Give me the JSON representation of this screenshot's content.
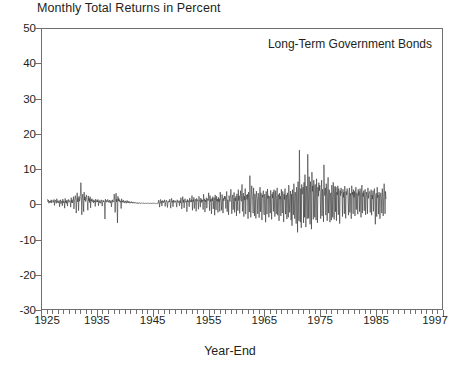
{
  "chart_data": {
    "type": "line",
    "title": "Monthly Total Returns in Percent",
    "annotation": "Long-Term Government Bonds",
    "xlabel": "Year-End",
    "ylabel": "",
    "xlim": [
      1925,
      1997
    ],
    "ylim": [
      -30,
      50
    ],
    "grid": false,
    "legend_position": "none",
    "line_color": "#333333",
    "axis_color": "#6f6f6f",
    "yticks": [
      50,
      40,
      30,
      20,
      10,
      0,
      -10,
      -20,
      -30
    ],
    "ytick_labels": [
      "50",
      "40",
      "30",
      "20",
      "10",
      "0",
      "-10",
      "-20",
      "-30"
    ],
    "xticks": [
      1925,
      1935,
      1945,
      1955,
      1965,
      1975,
      1985,
      1997
    ],
    "xtick_labels": [
      "1925",
      "1935",
      "1945",
      "1955",
      "1965",
      "1975",
      "1985",
      "1997"
    ],
    "x_minor_tick_interval": 1,
    "series_name": "Long-Term Government Bonds monthly total return",
    "x_start": 1926.0,
    "x_step": 0.0833333,
    "units": "percent",
    "values": [
      1.4,
      0.6,
      1.1,
      0.2,
      0.8,
      0.5,
      0.9,
      0.4,
      1.2,
      0.3,
      0.7,
      1.0,
      0.9,
      0.5,
      1.3,
      -0.4,
      0.8,
      1.1,
      0.6,
      0.2,
      1.5,
      0.4,
      0.9,
      0.7,
      0.3,
      1.0,
      -0.8,
      0.5,
      1.2,
      0.1,
      0.6,
      0.9,
      -0.5,
      1.4,
      0.3,
      0.8,
      0.7,
      -1.2,
      1.6,
      0.4,
      0.9,
      0.2,
      1.1,
      -0.6,
      0.8,
      1.3,
      0.5,
      0.7,
      1.0,
      0.6,
      -0.9,
      1.8,
      0.4,
      1.2,
      0.3,
      0.9,
      2.1,
      -1.4,
      0.7,
      1.5,
      2.4,
      0.9,
      -2.6,
      1.1,
      3.2,
      0.6,
      1.8,
      -1.9,
      2.2,
      0.8,
      1.4,
      2.9,
      6.1,
      2.2,
      -3.1,
      1.6,
      2.8,
      0.9,
      -2.2,
      3.4,
      1.1,
      2.0,
      0.7,
      1.9,
      2.6,
      1.2,
      0.5,
      -1.8,
      2.3,
      0.9,
      1.6,
      0.4,
      2.1,
      -1.1,
      1.3,
      0.8,
      1.5,
      0.7,
      1.0,
      0.3,
      1.2,
      0.6,
      0.9,
      -0.7,
      1.4,
      0.5,
      0.8,
      1.1,
      0.6,
      1.3,
      -0.5,
      0.9,
      0.4,
      1.0,
      0.7,
      0.2,
      1.2,
      0.8,
      -0.6,
      0.5,
      1.1,
      0.6,
      0.9,
      0.3,
      -4.3,
      1.4,
      0.7,
      1.0,
      0.5,
      0.8,
      1.3,
      0.6,
      0.9,
      0.4,
      1.1,
      0.7,
      0.3,
      1.0,
      -0.8,
      0.6,
      1.2,
      0.5,
      0.9,
      0.7,
      2.8,
      1.1,
      -2.4,
      0.8,
      3.1,
      0.6,
      1.4,
      -5.4,
      2.2,
      0.9,
      1.6,
      0.7,
      1.2,
      0.5,
      0.8,
      -1.3,
      1.5,
      0.6,
      0.9,
      0.4,
      1.1,
      0.7,
      0.3,
      0.8,
      0.5,
      0.9,
      0.2,
      0.6,
      1.0,
      0.4,
      0.7,
      0.3,
      0.8,
      0.5,
      0.2,
      0.6,
      0.4,
      0.7,
      0.3,
      0.5,
      0.2,
      0.6,
      0.4,
      0.3,
      0.5,
      0.2,
      0.4,
      0.3,
      0.3,
      0.2,
      0.4,
      0.1,
      0.3,
      0.2,
      0.4,
      0.2,
      0.3,
      0.1,
      0.2,
      0.3,
      0.2,
      0.3,
      0.1,
      0.2,
      0.3,
      0.2,
      0.1,
      0.3,
      0.2,
      0.1,
      0.2,
      0.3,
      0.2,
      0.1,
      0.3,
      0.2,
      0.1,
      0.2,
      0.3,
      0.1,
      0.2,
      0.1,
      0.3,
      0.2,
      0.1,
      0.2,
      0.1,
      0.3,
      0.2,
      0.1,
      0.2,
      0.1,
      0.2,
      0.3,
      0.1,
      0.2,
      1.1,
      0.4,
      -0.9,
      0.7,
      1.3,
      0.2,
      0.8,
      -0.6,
      1.0,
      0.5,
      0.3,
      0.9,
      0.6,
      1.2,
      -0.7,
      0.4,
      0.8,
      1.1,
      0.3,
      -1.0,
      0.7,
      0.5,
      0.9,
      0.6,
      1.4,
      0.3,
      -1.2,
      0.8,
      1.6,
      0.5,
      0.9,
      -0.8,
      1.1,
      0.4,
      0.7,
      1.0,
      0.5,
      0.8,
      0.3,
      -0.9,
      1.2,
      0.6,
      0.4,
      0.9,
      0.7,
      -0.5,
      1.0,
      0.3,
      1.8,
      0.6,
      -1.4,
      0.9,
      2.1,
      0.4,
      1.2,
      -1.1,
      0.8,
      1.5,
      0.5,
      0.7,
      0.9,
      -2.2,
      1.3,
      0.6,
      1.0,
      0.4,
      -0.8,
      1.7,
      0.5,
      0.9,
      1.2,
      0.6,
      2.4,
      -1.8,
      1.1,
      0.7,
      1.9,
      -1.3,
      0.8,
      1.4,
      0.5,
      -2.1,
      1.6,
      0.9,
      1.2,
      0.6,
      -1.5,
      2.2,
      0.8,
      1.0,
      -0.9,
      1.7,
      0.4,
      1.3,
      0.7,
      1.1,
      -1.6,
      2.8,
      0.9,
      1.4,
      -2.3,
      1.1,
      0.6,
      1.8,
      -1.2,
      0.8,
      1.5,
      1.0,
      3.2,
      1.1,
      -1.9,
      2.4,
      0.7,
      1.3,
      -2.8,
      1.6,
      0.9,
      2.1,
      -1.4,
      1.2,
      1.8,
      -3.2,
      2.6,
      1.0,
      -1.7,
      2.2,
      0.8,
      1.4,
      -2.4,
      1.9,
      0.6,
      1.5,
      -2.1,
      3.4,
      1.2,
      0.8,
      -1.8,
      2.7,
      1.1,
      -2.6,
      1.6,
      0.9,
      2.3,
      1.4,
      2.1,
      -1.3,
      1.8,
      3.6,
      -2.2,
      1.2,
      0.9,
      -3.1,
      2.4,
      1.5,
      0.7,
      2.0,
      4.2,
      1.3,
      -2.8,
      1.9,
      2.6,
      -1.6,
      1.1,
      3.3,
      -2.4,
      1.7,
      0.9,
      2.2,
      -3.4,
      2.9,
      1.4,
      -1.9,
      4.1,
      1.0,
      2.3,
      -2.7,
      1.6,
      3.8,
      1.2,
      0.8,
      5.6,
      -2.1,
      1.9,
      3.1,
      -3.6,
      2.2,
      1.1,
      4.4,
      -2.9,
      1.7,
      2.6,
      1.3,
      2.8,
      -4.2,
      3.4,
      1.6,
      -2.3,
      8.1,
      2.1,
      -3.8,
      1.4,
      5.2,
      2.7,
      1.1,
      -2.6,
      4.6,
      1.8,
      -3.4,
      2.9,
      1.3,
      -4.1,
      3.7,
      2.2,
      1.5,
      -2.8,
      3.1,
      2.4,
      -3.9,
      1.7,
      4.8,
      -2.2,
      3.2,
      1.1,
      -4.6,
      2.6,
      1.9,
      3.8,
      -2.4,
      -3.1,
      2.8,
      1.4,
      -5.2,
      3.6,
      2.1,
      -2.9,
      4.3,
      1.6,
      2.4,
      -3.8,
      1.9,
      2.2,
      -2.6,
      3.9,
      1.3,
      -4.4,
      2.8,
      1.7,
      3.4,
      -2.1,
      4.1,
      1.2,
      -3.6,
      3.8,
      1.5,
      -2.8,
      2.4,
      4.6,
      -3.2,
      1.9,
      2.7,
      -4.8,
      3.1,
      1.4,
      2.2,
      -3.4,
      4.2,
      1.8,
      -2.6,
      3.6,
      2.1,
      -5.1,
      2.8,
      1.3,
      4.4,
      -2.9,
      2.3,
      2.6,
      -4.3,
      3.2,
      1.7,
      -3.8,
      5.4,
      2.2,
      -2.4,
      1.9,
      3.7,
      -4.6,
      2.8,
      -6.2,
      4.1,
      2.4,
      -3.1,
      5.8,
      1.6,
      -4.2,
      3.4,
      2.1,
      -5.6,
      4.8,
      2.6,
      -8.1,
      6.4,
      2.2,
      -4.8,
      15.4,
      3.1,
      -5.2,
      4.4,
      -6.8,
      5.6,
      2.8,
      3.2,
      4.8,
      -5.4,
      6.2,
      -3.8,
      8.4,
      2.6,
      -6.6,
      5.1,
      3.4,
      -4.2,
      14.2,
      4.6,
      -4.1,
      7.8,
      3.2,
      -5.8,
      6.4,
      2.8,
      -7.2,
      9.1,
      3.6,
      5.2,
      -4.4,
      6.8,
      3.4,
      -3.8,
      5.6,
      2.9,
      -4.6,
      7.2,
      3.1,
      -5.4,
      4.8,
      2.2,
      6.1,
      3.8,
      5.4,
      2.6,
      -4.2,
      3.8,
      6.8,
      -3.4,
      4.2,
      2.8,
      -5.1,
      11.2,
      3.6,
      2.4,
      4.6,
      -3.2,
      5.8,
      2.2,
      -4.8,
      3.4,
      7.6,
      -2.6,
      4.1,
      3.8,
      -5.2,
      2.9,
      3.2,
      -4.6,
      5.4,
      2.1,
      -3.8,
      6.2,
      2.8,
      -4.4,
      3.6,
      5.1,
      -2.2,
      4.8,
      -4.8,
      3.4,
      2.6,
      5.2,
      -3.1,
      4.4,
      1.8,
      -5.6,
      3.8,
      2.4,
      4.6,
      3.1,
      2.8,
      -3.6,
      4.2,
      1.9,
      3.4,
      -2.8,
      5.1,
      2.2,
      -4.1,
      3.6,
      2.6,
      4.4,
      3.8,
      1.6,
      -3.2,
      2.8,
      4.6,
      -2.4,
      3.1,
      1.8,
      -4.2,
      5.2,
      2.6,
      3.4,
      -2.8,
      4.1,
      1.9,
      3.6,
      -3.4,
      2.2,
      4.8,
      -1.6,
      3.2,
      2.8,
      -2.9,
      4.2,
      2.4,
      3.6,
      -2.2,
      4.4,
      1.8,
      -3.8,
      2.9,
      5.4,
      -2.6,
      3.2,
      2.1,
      3.8,
      -1.9,
      2.6,
      4.2,
      -3.1,
      1.8,
      3.4,
      2.2,
      -2.8,
      4.6,
      1.6,
      2.9,
      3.2,
      3.6,
      -2.4,
      1.9,
      4.1,
      -3.2,
      2.6,
      1.4,
      3.8,
      -2.1,
      2.8,
      4.4,
      1.7,
      -5.8,
      2.4,
      3.1,
      -3.6,
      4.8,
      1.8,
      2.6,
      -2.9,
      3.4,
      2.1,
      -4.2,
      2.8,
      3.2,
      1.6,
      -2.6,
      4.4,
      2.2,
      -3.4,
      1.9,
      5.8,
      2.6,
      -2.8,
      3.6,
      1.4
    ]
  }
}
